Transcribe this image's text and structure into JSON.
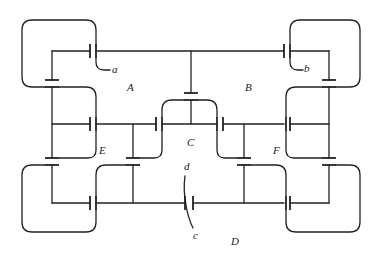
{
  "diagram": {
    "type": "capacitor network (electrostatic conductors)",
    "labels": {
      "region_A": "A",
      "region_B": "B",
      "region_C": "C",
      "region_D": "D",
      "region_E": "E",
      "region_F": "F",
      "terminal_a": "a",
      "terminal_b": "b",
      "terminal_c": "c",
      "terminal_d": "d"
    },
    "colors": {
      "line": "#222222",
      "background": "#ffffff"
    }
  }
}
